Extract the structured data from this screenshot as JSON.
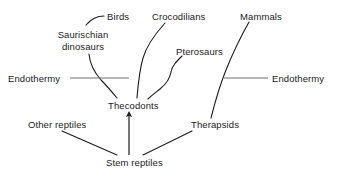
{
  "diagram": {
    "type": "cladogram",
    "background_color": "#ffffff",
    "line_color": "#1b1b1b",
    "marker_line_color": "#6e6e6e",
    "text_color": "#1b1b1b",
    "nodes": {
      "birds": "Birds",
      "saurischian_dinosaurs_line1": "Saurischian",
      "saurischian_dinosaurs_line2": "dinosaurs",
      "crocodilians": "Crocodilians",
      "pterosaurs": "Pterosaurs",
      "mammals": "Mammals",
      "endothermy_left": "Endothermy",
      "endothermy_right": "Endothermy",
      "thecodonts": "Thecodonts",
      "other_reptiles": "Other reptiles",
      "therapsids": "Therapsids",
      "stem_reptiles": "Stem reptiles"
    },
    "connections": [
      {
        "from": "birds",
        "to": "saurischian_dinosaurs",
        "style": "curve"
      },
      {
        "from": "saurischian_dinosaurs",
        "to": "thecodonts",
        "style": "curve"
      },
      {
        "from": "crocodilians",
        "to": "thecodonts",
        "style": "curve"
      },
      {
        "from": "pterosaurs",
        "to": "thecodonts",
        "style": "curve"
      },
      {
        "from": "mammals",
        "to": "therapsids",
        "style": "curve"
      },
      {
        "from": "stem_reptiles",
        "to": "thecodonts",
        "style": "arrow"
      },
      {
        "from": "stem_reptiles",
        "to": "other_reptiles",
        "style": "line"
      },
      {
        "from": "stem_reptiles",
        "to": "therapsids",
        "style": "line"
      }
    ],
    "markers": [
      {
        "name": "endothermy-left-marker",
        "label": "Endothermy",
        "side": "left"
      },
      {
        "name": "endothermy-right-marker",
        "label": "Endothermy",
        "side": "right"
      }
    ]
  }
}
